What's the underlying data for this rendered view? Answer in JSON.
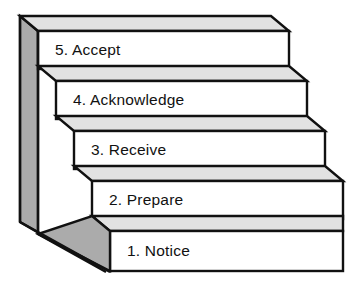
{
  "diagram": {
    "type": "staircase-steps",
    "orientation": "ascending-right-to-left",
    "step_count": 5,
    "colors": {
      "tread": "#e2e2e2",
      "riser": "#ffffff",
      "side_panel": "#ababab",
      "outline": "#111111",
      "text": "#111111",
      "background": "#ffffff"
    },
    "steps": [
      {
        "number": "5.",
        "name": "Accept",
        "label": "5. Accept"
      },
      {
        "number": "4.",
        "name": "Acknowledge",
        "label": "4. Acknowledge"
      },
      {
        "number": "3.",
        "name": "Receive",
        "label": "3. Receive"
      },
      {
        "number": "2.",
        "name": "Prepare",
        "label": "2. Prepare"
      },
      {
        "number": "1.",
        "name": "Notice",
        "label": "1. Notice"
      }
    ]
  }
}
